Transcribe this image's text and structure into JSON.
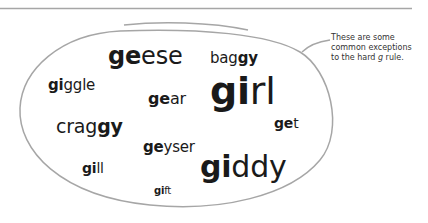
{
  "colors": {
    "rule": "#a6a6a6",
    "outline": "#a6a6a6",
    "text": "#1a1a1a",
    "note_text": "#333333"
  },
  "words": [
    {
      "id": "geese",
      "bold": "ge",
      "rest": "ese",
      "bold_suffix": false,
      "x": 108,
      "y": 44,
      "size": 24
    },
    {
      "id": "baggy",
      "bold": "gy",
      "rest": "bag",
      "bold_suffix": true,
      "x": 210,
      "y": 51,
      "size": 15
    },
    {
      "id": "giggle",
      "bold": "gi",
      "rest": "ggle",
      "bold_suffix": false,
      "x": 48,
      "y": 78,
      "size": 15
    },
    {
      "id": "gear",
      "bold": "ge",
      "rest": "ar",
      "bold_suffix": false,
      "x": 148,
      "y": 91,
      "size": 16
    },
    {
      "id": "girl",
      "bold": "gi",
      "rest": "rl",
      "bold_suffix": false,
      "x": 210,
      "y": 72,
      "size": 38
    },
    {
      "id": "craggy",
      "bold": "gy",
      "rest": "crag",
      "bold_suffix": true,
      "x": 56,
      "y": 117,
      "size": 19
    },
    {
      "id": "get",
      "bold": "ge",
      "rest": "t",
      "bold_suffix": false,
      "x": 274,
      "y": 116,
      "size": 14
    },
    {
      "id": "geyser",
      "bold": "ge",
      "rest": "yser",
      "bold_suffix": false,
      "x": 143,
      "y": 140,
      "size": 15
    },
    {
      "id": "gill",
      "bold": "gi",
      "rest": "ll",
      "bold_suffix": false,
      "x": 82,
      "y": 161,
      "size": 14
    },
    {
      "id": "giddy",
      "bold": "gi",
      "rest": "ddy",
      "bold_suffix": false,
      "x": 200,
      "y": 152,
      "size": 30
    },
    {
      "id": "gift",
      "bold": "gi",
      "rest": "ft",
      "bold_suffix": false,
      "x": 154,
      "y": 186,
      "size": 10
    }
  ],
  "annotation": {
    "line1": "These are some",
    "line2": "common exceptions",
    "line3_prefix": "to the hard ",
    "line3_italic": "g",
    "line3_suffix": " rule."
  }
}
